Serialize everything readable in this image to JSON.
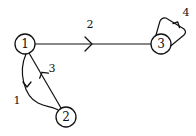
{
  "diagram": {
    "type": "directed-graph",
    "nodes": [
      {
        "id": "1",
        "label": "1",
        "cx": 25,
        "cy": 44
      },
      {
        "id": "2",
        "label": "2",
        "cx": 66,
        "cy": 117
      },
      {
        "id": "3",
        "label": "3",
        "cx": 161,
        "cy": 44
      }
    ],
    "edges": [
      {
        "id": "e1",
        "label": "1",
        "from": "1",
        "to": "2",
        "shape": "curved"
      },
      {
        "id": "e2",
        "label": "2",
        "from": "1",
        "to": "3",
        "shape": "straight"
      },
      {
        "id": "e3",
        "label": "3",
        "from": "2",
        "to": "1",
        "shape": "straight"
      },
      {
        "id": "e4",
        "label": "4",
        "from": "3",
        "to": "3",
        "shape": "self-loop"
      }
    ],
    "colors": {
      "stroke": "#111111",
      "background": "#ffffff"
    }
  }
}
